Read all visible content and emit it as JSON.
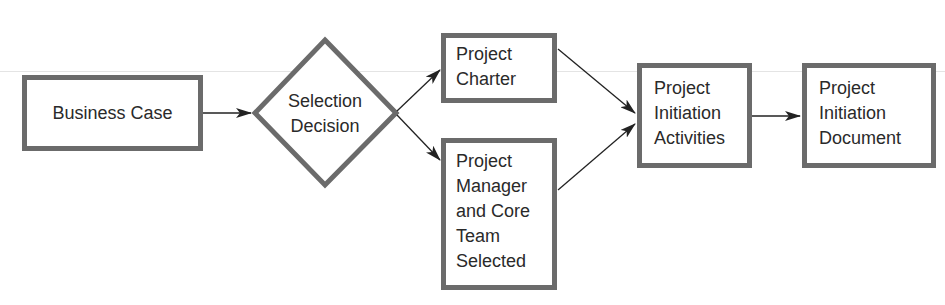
{
  "diagram": {
    "type": "flowchart",
    "nodes": {
      "business_case": {
        "shape": "rectangle",
        "label": "Business Case"
      },
      "selection_decision": {
        "shape": "diamond",
        "line1": "Selection",
        "line2": "Decision"
      },
      "project_charter": {
        "shape": "rectangle",
        "line1": "Project",
        "line2": "Charter"
      },
      "pm_core_team": {
        "shape": "rectangle",
        "line1": "Project",
        "line2": "Manager",
        "line3": "and Core",
        "line4": "Team",
        "line5": "Selected"
      },
      "initiation_activities": {
        "shape": "rectangle",
        "line1": "Project",
        "line2": "Initiation",
        "line3": "Activities"
      },
      "initiation_document": {
        "shape": "rectangle",
        "line1": "Project",
        "line2": "Initiation",
        "line3": "Document"
      }
    },
    "edges": [
      {
        "from": "Business Case",
        "to": "Selection Decision"
      },
      {
        "from": "Selection Decision",
        "to": "Project Charter"
      },
      {
        "from": "Selection Decision",
        "to": "Project Manager and Core Team Selected"
      },
      {
        "from": "Project Charter",
        "to": "Project Initiation Activities"
      },
      {
        "from": "Project Manager and Core Team Selected",
        "to": "Project Initiation Activities"
      },
      {
        "from": "Project Initiation Activities",
        "to": "Project Initiation Document"
      }
    ],
    "colors": {
      "border": "#6b6b6b",
      "arrow": "#222222",
      "text": "#2a2a2a"
    }
  }
}
